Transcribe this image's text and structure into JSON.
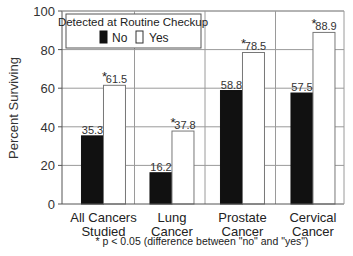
{
  "chart_data": {
    "type": "bar",
    "title": "",
    "xlabel": "",
    "ylabel": "Percent Surviving",
    "ylim": [
      0,
      100
    ],
    "yticks": [
      0,
      20,
      40,
      60,
      80,
      100
    ],
    "grid": true,
    "categories": [
      "All Cancers Studied",
      "Lung Cancer",
      "Prostate Cancer",
      "Cervical Cancer"
    ],
    "category_lines": [
      [
        "All Cancers",
        "Studied"
      ],
      [
        "Lung",
        "Cancer"
      ],
      [
        "Prostate",
        "Cancer"
      ],
      [
        "Cervical",
        "Cancer"
      ]
    ],
    "legend": {
      "title": "Detected at Routine Checkup",
      "position": "top-left inside",
      "entries": [
        "No",
        "Yes"
      ]
    },
    "series": [
      {
        "name": "No",
        "color": "#111111",
        "values": [
          35.3,
          16.2,
          58.8,
          57.5
        ],
        "labels": [
          "35.3",
          "16.2",
          "58.8",
          "57.5"
        ],
        "significant": [
          false,
          false,
          false,
          false
        ]
      },
      {
        "name": "Yes",
        "color": "#ffffff",
        "values": [
          61.5,
          37.8,
          78.5,
          88.9
        ],
        "labels": [
          "61.5",
          "37.8",
          "78.5",
          "88.9"
        ],
        "significant": [
          true,
          true,
          true,
          true
        ]
      }
    ],
    "annotations": [
      "* p < 0.05 (difference between \"no\" and \"yes\")"
    ]
  },
  "footnote": "* p < 0.05 (difference between \"no\" and \"yes\")"
}
